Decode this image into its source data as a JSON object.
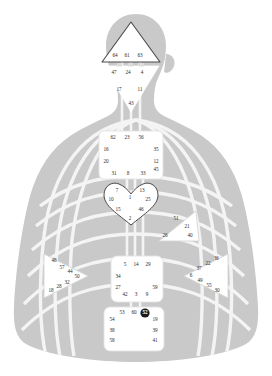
{
  "graphic": {
    "title": "Human Design BodyGraph",
    "colors": {
      "body_silhouette": "#c9c9c9",
      "channel_stroke": "#f2f2f2",
      "center_fill": "#ffffff",
      "center_stroke": "#4a4a4a",
      "gate_text": "#2b2b2b",
      "gate_active_fill": "#1a1a1a",
      "gate_active_text": "#ffffff",
      "background": "#ffffff"
    }
  },
  "centers": [
    {
      "name": "head",
      "shape": "triangle",
      "gates": [
        {
          "num": "64",
          "x": 115,
          "y": 56,
          "active": false
        },
        {
          "num": "61",
          "x": 127,
          "y": 56,
          "active": false
        },
        {
          "num": "63",
          "x": 140,
          "y": 56,
          "active": false
        }
      ]
    },
    {
      "name": "ajna",
      "shape": "triangle-inverted",
      "gates": [
        {
          "num": "47",
          "x": 114,
          "y": 73,
          "active": false
        },
        {
          "num": "24",
          "x": 128,
          "y": 73,
          "active": false
        },
        {
          "num": "4",
          "x": 142,
          "y": 73,
          "active": false
        },
        {
          "num": "17",
          "x": 119,
          "y": 90,
          "active": false
        },
        {
          "num": "11",
          "x": 140,
          "y": 90,
          "active": false
        },
        {
          "num": "43",
          "x": 131,
          "y": 104,
          "active": false
        }
      ]
    },
    {
      "name": "throat",
      "shape": "square",
      "gates": [
        {
          "num": "62",
          "x": 113,
          "y": 138,
          "active": false
        },
        {
          "num": "23",
          "x": 127,
          "y": 138,
          "active": false
        },
        {
          "num": "56",
          "x": 141,
          "y": 138,
          "active": false
        },
        {
          "num": "16",
          "x": 106,
          "y": 150,
          "active": false
        },
        {
          "num": "35",
          "x": 156,
          "y": 150,
          "active": false
        },
        {
          "num": "20",
          "x": 106,
          "y": 162,
          "active": false
        },
        {
          "num": "12",
          "x": 156,
          "y": 162,
          "active": false
        },
        {
          "num": "45",
          "x": 156,
          "y": 170,
          "active": false
        },
        {
          "num": "31",
          "x": 114,
          "y": 174,
          "active": false
        },
        {
          "num": "8",
          "x": 128,
          "y": 174,
          "active": false
        },
        {
          "num": "33",
          "x": 143,
          "y": 174,
          "active": false
        }
      ]
    },
    {
      "name": "g-center",
      "shape": "heart",
      "gates": [
        {
          "num": "7",
          "x": 117,
          "y": 191,
          "active": false
        },
        {
          "num": "13",
          "x": 142,
          "y": 191,
          "active": false
        },
        {
          "num": "1",
          "x": 130,
          "y": 198,
          "active": false
        },
        {
          "num": "10",
          "x": 111,
          "y": 200,
          "active": false
        },
        {
          "num": "25",
          "x": 148,
          "y": 200,
          "active": false
        },
        {
          "num": "15",
          "x": 118,
          "y": 210,
          "active": false
        },
        {
          "num": "46",
          "x": 141,
          "y": 210,
          "active": false
        },
        {
          "num": "2",
          "x": 130,
          "y": 219,
          "active": false
        }
      ]
    },
    {
      "name": "ego-heart",
      "shape": "triangle-left",
      "gates": [
        {
          "num": "51",
          "x": 176,
          "y": 219,
          "active": false
        },
        {
          "num": "21",
          "x": 187,
          "y": 227,
          "active": false
        },
        {
          "num": "26",
          "x": 165,
          "y": 236,
          "active": false
        },
        {
          "num": "40",
          "x": 190,
          "y": 236,
          "active": false
        }
      ]
    },
    {
      "name": "spleen",
      "shape": "triangle-right",
      "gates": [
        {
          "num": "48",
          "x": 54,
          "y": 261,
          "active": false
        },
        {
          "num": "57",
          "x": 62,
          "y": 268,
          "active": false
        },
        {
          "num": "44",
          "x": 70,
          "y": 272,
          "active": false
        },
        {
          "num": "50",
          "x": 77,
          "y": 277,
          "active": false
        },
        {
          "num": "32",
          "x": 67,
          "y": 283,
          "active": false
        },
        {
          "num": "28",
          "x": 59,
          "y": 287,
          "active": false
        },
        {
          "num": "18",
          "x": 51,
          "y": 291,
          "active": false
        }
      ]
    },
    {
      "name": "sacral",
      "shape": "square",
      "gates": [
        {
          "num": "5",
          "x": 125,
          "y": 265,
          "active": false
        },
        {
          "num": "14",
          "x": 136,
          "y": 265,
          "active": false
        },
        {
          "num": "29",
          "x": 148,
          "y": 265,
          "active": false
        },
        {
          "num": "34",
          "x": 118,
          "y": 277,
          "active": false
        },
        {
          "num": "27",
          "x": 118,
          "y": 288,
          "active": false
        },
        {
          "num": "59",
          "x": 155,
          "y": 288,
          "active": false
        },
        {
          "num": "42",
          "x": 125,
          "y": 295,
          "active": false
        },
        {
          "num": "3",
          "x": 136,
          "y": 295,
          "active": false
        },
        {
          "num": "9",
          "x": 147,
          "y": 295,
          "active": false
        }
      ]
    },
    {
      "name": "solar-plexus",
      "shape": "triangle-left",
      "gates": [
        {
          "num": "36",
          "x": 216,
          "y": 259,
          "active": false
        },
        {
          "num": "22",
          "x": 208,
          "y": 264,
          "active": false
        },
        {
          "num": "37",
          "x": 199,
          "y": 269,
          "active": false
        },
        {
          "num": "6",
          "x": 191,
          "y": 276,
          "active": false
        },
        {
          "num": "49",
          "x": 200,
          "y": 281,
          "active": false
        },
        {
          "num": "55",
          "x": 209,
          "y": 286,
          "active": false
        },
        {
          "num": "30",
          "x": 217,
          "y": 291,
          "active": false
        }
      ]
    },
    {
      "name": "root",
      "shape": "square",
      "gates": [
        {
          "num": "53",
          "x": 122,
          "y": 313,
          "active": false
        },
        {
          "num": "60",
          "x": 134,
          "y": 313,
          "active": false
        },
        {
          "num": "52",
          "x": 145,
          "y": 313,
          "active": true
        },
        {
          "num": "54",
          "x": 112,
          "y": 320,
          "active": false
        },
        {
          "num": "19",
          "x": 155,
          "y": 320,
          "active": false
        },
        {
          "num": "38",
          "x": 112,
          "y": 331,
          "active": false
        },
        {
          "num": "39",
          "x": 155,
          "y": 331,
          "active": false
        },
        {
          "num": "58",
          "x": 112,
          "y": 341,
          "active": false
        },
        {
          "num": "41",
          "x": 155,
          "y": 341,
          "active": false
        }
      ]
    }
  ]
}
